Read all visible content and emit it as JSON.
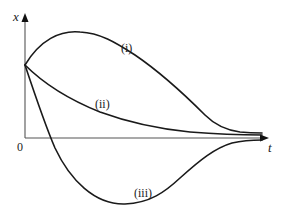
{
  "diagram": {
    "axes": {
      "y_label": "x",
      "x_label": "t",
      "origin_label": "0"
    },
    "curves": [
      {
        "id": "i",
        "label": "(i)",
        "description": "rises to a maximum then decays toward zero from above"
      },
      {
        "id": "ii",
        "label": "(ii)",
        "description": "decays monotonically toward zero from above"
      },
      {
        "id": "iii",
        "label": "(iii)",
        "description": "drops below zero to a minimum then returns toward zero from below"
      }
    ],
    "colors": {
      "curve": "#1a1a1a",
      "axis": "#555555",
      "background": "#ffffff"
    }
  }
}
